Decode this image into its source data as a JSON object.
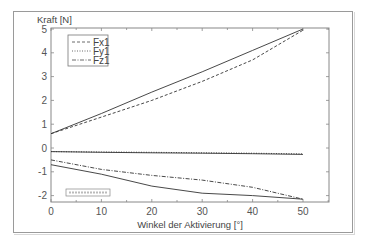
{
  "chart_data": {
    "type": "line",
    "title": "",
    "ylabel": "Kraft [N]",
    "xlabel": "Winkel der Aktivierung [°]",
    "xlim": [
      0,
      55
    ],
    "ylim": [
      -2.3,
      5
    ],
    "xticks": [
      0,
      10,
      20,
      30,
      40,
      50
    ],
    "yticks": [
      -2,
      -1,
      0,
      1,
      2,
      3,
      4,
      5
    ],
    "grid": false,
    "legend_position": "upper-left",
    "x": [
      0,
      10,
      20,
      30,
      40,
      50
    ],
    "series": [
      {
        "name": "Fx1",
        "style": "dashed",
        "in_legend": true,
        "values": [
          0.6,
          1.3,
          2.0,
          2.8,
          3.7,
          4.95
        ]
      },
      {
        "name": "Fy1",
        "style": "dotted",
        "in_legend": true,
        "values": [
          -0.15,
          -0.17,
          -0.18,
          -0.2,
          -0.22,
          -0.25
        ]
      },
      {
        "name": "Fz1",
        "style": "dash-dot",
        "in_legend": true,
        "values": [
          -0.5,
          -0.9,
          -1.15,
          -1.35,
          -1.65,
          -2.15
        ]
      },
      {
        "name": "",
        "style": "solid",
        "in_legend": false,
        "values": [
          0.6,
          1.45,
          2.35,
          3.2,
          4.1,
          5.0
        ]
      },
      {
        "name": "",
        "style": "solid",
        "in_legend": false,
        "values": [
          -0.15,
          -0.18,
          -0.2,
          -0.22,
          -0.24,
          -0.27
        ]
      },
      {
        "name": "",
        "style": "solid",
        "in_legend": false,
        "values": [
          -0.7,
          -1.1,
          -1.6,
          -1.9,
          -2.0,
          -2.15
        ]
      }
    ],
    "annotation_box": "illegible small text"
  },
  "labels": {
    "ylabel": "Kraft [N]",
    "xlabel": "Winkel der Aktivierung [°]",
    "legend": [
      "Fx1",
      "Fy1",
      "Fz1"
    ],
    "xticks": [
      "0",
      "10",
      "20",
      "30",
      "40",
      "50"
    ],
    "yticks": [
      "-2",
      "-1",
      "0",
      "1",
      "2",
      "3",
      "4",
      "5"
    ]
  },
  "colors": {
    "line": "#333333",
    "axis": "#888888",
    "text": "#555555"
  }
}
